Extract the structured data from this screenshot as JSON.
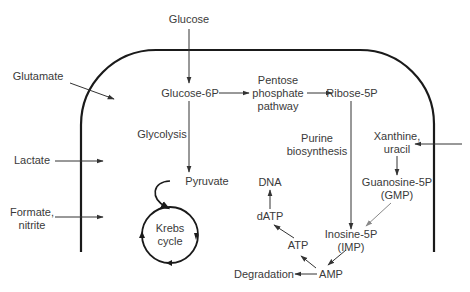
{
  "diagram": {
    "type": "metabolic-pathway",
    "colors": {
      "membrane": "#1a1a1a",
      "arrow": "#333333",
      "arrow_light": "#888888",
      "text": "#3a3a3a",
      "background": "#ffffff"
    },
    "nodes": {
      "glucose": "Glucose",
      "glutamate": "Glutamate",
      "glucose6p": "Glucose-6P",
      "pentose_line1": "Pentose",
      "pentose_line2": "phosphate",
      "pentose_line3": "pathway",
      "ribose5p": "Ribose-5P",
      "glycolysis": "Glycolysis",
      "purine_line1": "Purine",
      "purine_line2": "biosynthesis",
      "xanthine_line1": "Xanthine,",
      "xanthine_line2": "uracil",
      "lactate": "Lactate",
      "pyruvate": "Pyruvate",
      "guanosine_line1": "Guanosine-5P",
      "guanosine_line2": "(GMP)",
      "dna": "DNA",
      "datp": "dATP",
      "formate_line1": "Formate,",
      "formate_line2": "nitrite",
      "krebs_line1": "Krebs",
      "krebs_line2": "cycle",
      "atp": "ATP",
      "inosine_line1": "Inosine-5P",
      "inosine_line2": "(IMP)",
      "degradation": "Degradation",
      "amp": "AMP"
    },
    "edges": [
      {
        "from": "Glucose",
        "to": "Glucose-6P"
      },
      {
        "from": "Glutamate",
        "to": "cell interior"
      },
      {
        "from": "Glucose-6P",
        "to": "Pentose phosphate pathway"
      },
      {
        "from": "Pentose phosphate pathway",
        "to": "Ribose-5P"
      },
      {
        "from": "Glucose-6P",
        "to": "Pyruvate",
        "label": "Glycolysis"
      },
      {
        "from": "Ribose-5P",
        "to": "Inosine-5P (IMP)",
        "label": "Purine biosynthesis"
      },
      {
        "from": "external",
        "to": "Xanthine, uracil"
      },
      {
        "from": "Xanthine, uracil",
        "to": "Guanosine-5P (GMP)"
      },
      {
        "from": "Guanosine-5P (GMP)",
        "to": "Inosine-5P (IMP)"
      },
      {
        "from": "Lactate",
        "to": "cell interior"
      },
      {
        "from": "Formate, nitrite",
        "to": "cell interior"
      },
      {
        "from": "Pyruvate",
        "to": "Krebs cycle"
      },
      {
        "from": "Inosine-5P (IMP)",
        "to": "AMP"
      },
      {
        "from": "AMP",
        "to": "Degradation"
      },
      {
        "from": "AMP",
        "to": "ATP"
      },
      {
        "from": "ATP",
        "to": "dATP"
      },
      {
        "from": "dATP",
        "to": "DNA"
      }
    ]
  }
}
